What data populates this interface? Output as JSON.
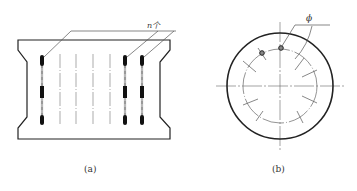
{
  "figure": {
    "panel_a": {
      "caption": "(a)",
      "count_label": "n个",
      "electrode_bars": 3,
      "dashed_lines": 4
    },
    "panel_b": {
      "caption": "(b)",
      "diameter_label": "ϕ",
      "holes": 2,
      "tick_marks": 8
    },
    "colors": {
      "stroke": "#222222",
      "leader": "#555555",
      "dashed": "#777777",
      "bar_fill": "#111111"
    }
  }
}
